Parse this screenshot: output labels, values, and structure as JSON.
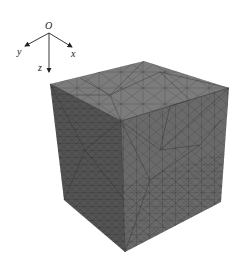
{
  "figure": {
    "type": "fem-mesh-cube",
    "colors": {
      "background": "#ffffff",
      "top_face": "#7c7c7c",
      "left_face": "#545454",
      "right_face": "#6a6a6a",
      "mesh_lines": "#2e2e2e",
      "axes": "#222222"
    }
  },
  "axes": {
    "origin_label": "O",
    "x_label": "x",
    "y_label": "y",
    "z_label": "z"
  }
}
